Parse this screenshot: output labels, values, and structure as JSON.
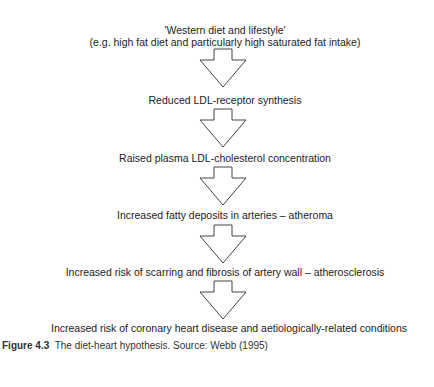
{
  "diagram": {
    "steps": [
      {
        "line1": "'Western diet and lifestyle'",
        "line2": "(e.g. high fat diet and particularly high saturated fat intake)"
      },
      {
        "line1": "Reduced LDL-receptor synthesis"
      },
      {
        "line1": "Raised plasma LDL-cholesterol concentration"
      },
      {
        "line1": "Increased fatty deposits in arteries – atheroma"
      },
      {
        "line1": "Increased risk of scarring and fibrosis of artery wall – atherosclerosis"
      },
      {
        "line1": "Increased risk of coronary heart disease and aetiologically-related conditions"
      }
    ],
    "arrow_icon": "down-block-arrow"
  },
  "caption": {
    "label": "Figure 4.3",
    "text": "The diet-heart hypothesis.",
    "source": "Source: Webb (1995)"
  }
}
